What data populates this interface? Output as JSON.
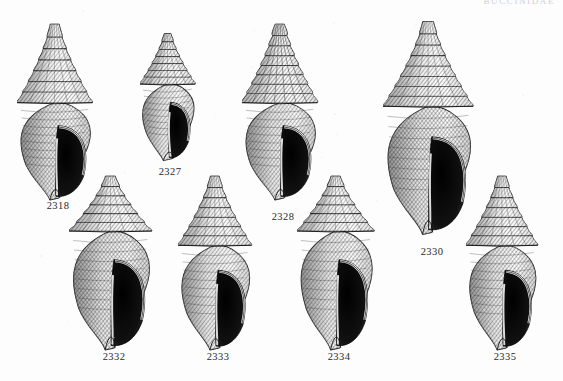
{
  "page": {
    "kind": "illustrated-plate",
    "running_head": "BUCCINIDAE",
    "background_color": "#fdfdfd",
    "ink_color": "#1a1a1a",
    "caption_color": "#2a2a2a"
  },
  "figures": [
    {
      "id": "fig-2318",
      "caption": "2318",
      "shell_form": "elongate-fusiform",
      "spire": "tall-acuminate",
      "whorls": 7,
      "shading": "dense cross-hatch, dark aperture",
      "aperture_side": "right",
      "x": 58,
      "y": 112,
      "width": 82,
      "height": 180,
      "caption_x": 58,
      "caption_y": 200
    },
    {
      "id": "fig-2327",
      "caption": "2327",
      "shell_form": "small-fusiform",
      "spire": "tall-stepped",
      "whorls": 7,
      "shading": "light spiral ribbing, outlined aperture",
      "aperture_side": "right",
      "x": 170,
      "y": 97,
      "width": 60,
      "height": 130,
      "caption_x": 170,
      "caption_y": 166
    },
    {
      "id": "fig-2328",
      "caption": "2328",
      "shell_form": "turreted-fusiform",
      "spire": "turreted-nodulose",
      "whorls": 8,
      "shading": "axial ribs, long siphonal canal",
      "aperture_side": "right",
      "x": 283,
      "y": 112,
      "width": 82,
      "height": 180,
      "caption_x": 283,
      "caption_y": 211
    },
    {
      "id": "fig-2330",
      "caption": "2330",
      "shell_form": "large-fusiform",
      "spire": "tall-conical",
      "whorls": 8,
      "shading": "heavy cross-hatch, broad aperture",
      "aperture_side": "right",
      "x": 432,
      "y": 128,
      "width": 98,
      "height": 218,
      "caption_x": 432,
      "caption_y": 246
    },
    {
      "id": "fig-2332",
      "caption": "2332",
      "shell_form": "broad-fusiform",
      "spire": "short-conical",
      "whorls": 6,
      "shading": "very dark aperture, coarse hatch",
      "aperture_side": "right",
      "x": 114,
      "y": 263,
      "width": 90,
      "height": 178,
      "caption_x": 114,
      "caption_y": 351
    },
    {
      "id": "fig-2333",
      "caption": "2333",
      "shell_form": "ovate-fusiform",
      "spire": "tall-slender",
      "whorls": 7,
      "shading": "fine stipple, pale body whorl",
      "aperture_side": "right",
      "x": 218,
      "y": 263,
      "width": 80,
      "height": 178,
      "caption_x": 218,
      "caption_y": 351
    },
    {
      "id": "fig-2334",
      "caption": "2334",
      "shell_form": "ovate",
      "spire": "moderate-conical",
      "whorls": 6,
      "shading": "axial striation, dark aperture",
      "aperture_side": "right",
      "x": 339,
      "y": 263,
      "width": 84,
      "height": 178,
      "caption_x": 339,
      "caption_y": 351
    },
    {
      "id": "fig-2335",
      "caption": "2335",
      "shell_form": "narrow-ovate",
      "spire": "tall-conical",
      "whorls": 7,
      "shading": "dark shading, glossy aperture lip",
      "aperture_side": "right",
      "x": 505,
      "y": 263,
      "width": 78,
      "height": 178,
      "caption_x": 505,
      "caption_y": 351
    }
  ]
}
